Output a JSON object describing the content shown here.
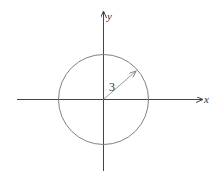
{
  "diagram": {
    "type": "circle-on-axes",
    "axes": {
      "x_label": "x",
      "y_label": "y"
    },
    "circle": {
      "center": "origin",
      "radius_label": "3",
      "radius": 3
    },
    "colors": {
      "axes": "#333333",
      "circle": "#777777",
      "radius_arrow": "#888888"
    }
  }
}
